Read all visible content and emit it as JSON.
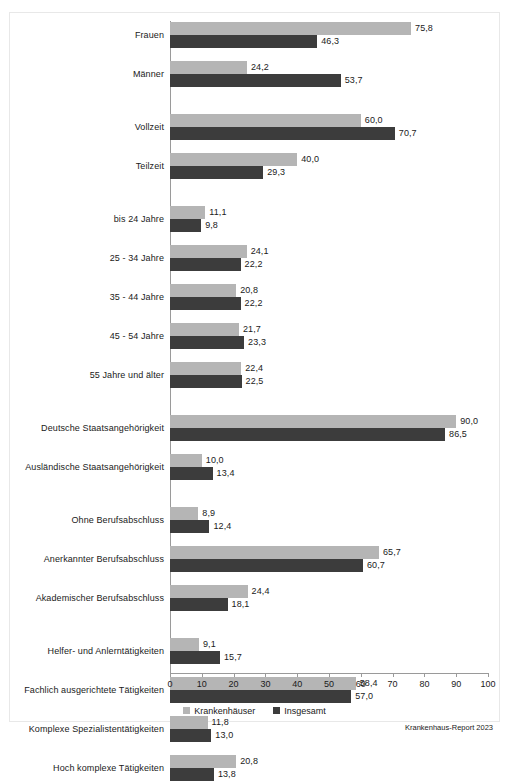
{
  "chart_data": {
    "type": "bar",
    "orientation": "horizontal",
    "title": "",
    "xlabel": "",
    "ylabel": "",
    "xlim": [
      0,
      100
    ],
    "xticks": [
      0,
      10,
      20,
      30,
      40,
      50,
      60,
      70,
      80,
      90,
      100
    ],
    "xticklabels": [
      "0",
      "10",
      "20",
      "30",
      "40",
      "50",
      "60",
      "70",
      "80",
      "90",
      "100"
    ],
    "grid": false,
    "legend_position": "bottom-center",
    "colors": {
      "krankenhaeuser": "#b5b5b5",
      "insgesamt": "#3c3c3c"
    },
    "categories": [
      "Frauen",
      "Männer",
      "Vollzeit",
      "Teilzeit",
      "bis 24 Jahre",
      "25 - 34 Jahre",
      "35 - 44 Jahre",
      "45 - 54 Jahre",
      "55 Jahre und älter",
      "Deutsche Staatsangehörigkeit",
      "Ausländische Staatsangehörigkeit",
      "Ohne Berufsabschluss",
      "Anerkannter Berufsabschluss",
      "Akademischer Berufsabschluss",
      "Helfer- und Anlerntätigkeiten",
      "Fachlich ausgerichtete Tätigkeiten",
      "Komplexe Spezialistentätigkeiten",
      "Hoch komplexe Tätigkeiten"
    ],
    "blocks": [
      {
        "name": "Geschlecht",
        "categories": [
          "Frauen",
          "Männer"
        ]
      },
      {
        "name": "Arbeitszeit",
        "categories": [
          "Vollzeit",
          "Teilzeit"
        ]
      },
      {
        "name": "Alter",
        "categories": [
          "bis 24 Jahre",
          "25 - 34 Jahre",
          "35 - 44 Jahre",
          "45 - 54 Jahre",
          "55 Jahre und älter"
        ]
      },
      {
        "name": "Staatsangehörigkeit",
        "categories": [
          "Deutsche Staatsangehörigkeit",
          "Ausländische Staatsangehörigkeit"
        ]
      },
      {
        "name": "Berufsabschluss",
        "categories": [
          "Ohne Berufsabschluss",
          "Anerkannter Berufsabschluss",
          "Akademischer Berufsabschluss"
        ]
      },
      {
        "name": "Anforderungsniveau",
        "categories": [
          "Helfer- und Anlerntätigkeiten",
          "Fachlich ausgerichtete Tätigkeiten",
          "Komplexe Spezialistentätigkeiten",
          "Hoch komplexe Tätigkeiten"
        ]
      }
    ],
    "series": [
      {
        "name": "Krankenhäuser",
        "color": "#b5b5b5",
        "values": [
          75.8,
          24.2,
          60.0,
          40.0,
          11.1,
          24.1,
          20.8,
          21.7,
          22.4,
          90.0,
          10.0,
          8.9,
          65.7,
          24.4,
          9.1,
          58.4,
          11.8,
          20.8
        ],
        "labels": [
          "75,8",
          "24,2",
          "60,0",
          "40,0",
          "11,1",
          "24,1",
          "20,8",
          "21,7",
          "22,4",
          "90,0",
          "10,0",
          "8,9",
          "65,7",
          "24,4",
          "9,1",
          "58,4",
          "11,8",
          "20,8"
        ]
      },
      {
        "name": "Insgesamt",
        "color": "#3c3c3c",
        "values": [
          46.3,
          53.7,
          70.7,
          29.3,
          9.8,
          22.2,
          22.2,
          23.3,
          22.5,
          86.5,
          13.4,
          12.4,
          60.7,
          18.1,
          15.7,
          57.0,
          13.0,
          13.8
        ],
        "labels": [
          "46,3",
          "53,7",
          "70,7",
          "29,3",
          "9,8",
          "22,2",
          "22,2",
          "23,3",
          "22,5",
          "86,5",
          "13,4",
          "12,4",
          "60,7",
          "18,1",
          "15,7",
          "57,0",
          "13,0",
          "13,8"
        ]
      }
    ]
  },
  "legend": {
    "items": [
      {
        "label": "Krankenhäuser",
        "swatch": "light"
      },
      {
        "label": "Insgesamt",
        "swatch": "dark"
      }
    ]
  },
  "source": {
    "text": "Krankenhaus-Report 2023"
  }
}
